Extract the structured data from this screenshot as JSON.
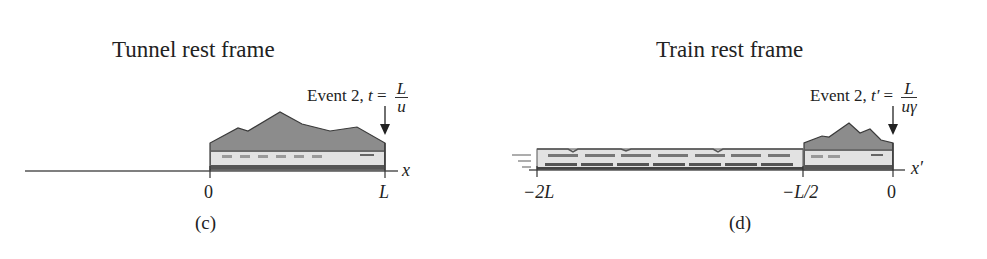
{
  "panels": [
    {
      "id": "c",
      "title": "Tunnel rest frame",
      "event": {
        "label": "Event 2,",
        "var": "t",
        "eq": "=",
        "num": "L",
        "den": "u"
      },
      "axis_label": "x",
      "ticks": [
        {
          "label": "0",
          "italic": false
        },
        {
          "label": "L",
          "italic": true
        }
      ],
      "caption": "(c)"
    },
    {
      "id": "d",
      "title": "Train rest frame",
      "event": {
        "label": "Event 2,",
        "var": "t′",
        "eq": "=",
        "num": "L",
        "den": "uγ"
      },
      "axis_label": "x′",
      "ticks": [
        {
          "label": "−2L",
          "italic": true
        },
        {
          "label": "−L/2",
          "italic": true
        },
        {
          "label": "0",
          "italic": false
        }
      ],
      "caption": "(d)"
    }
  ],
  "colors": {
    "mountain": "#8a8a8a",
    "mountain_edge": "#444444",
    "train_body": "#e4e4e4",
    "train_dark": "#555555",
    "axis": "#555555"
  }
}
